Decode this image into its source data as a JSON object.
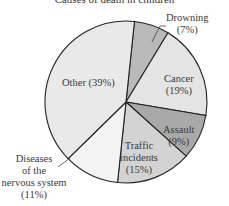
{
  "chart_data": {
    "type": "pie",
    "title": "Causes of death in children",
    "start_angle_deg": 6,
    "slices": [
      {
        "label": "Drowning",
        "pct_label": "(7%)",
        "value": 7,
        "color": "#b9b9b9"
      },
      {
        "label": "Cancer",
        "pct_label": "(19%)",
        "value": 19,
        "color": "#e4e4e4"
      },
      {
        "label": "Assault",
        "pct_label": "(9%)",
        "value": 9,
        "color": "#a9a9a9"
      },
      {
        "label": "Traffic incidents",
        "pct_label": "(15%)",
        "value": 15,
        "color": "#d3d3d3"
      },
      {
        "label": "Diseases of the nervous system",
        "pct_label": "(11%)",
        "value": 11,
        "color": "#f3f3f3"
      },
      {
        "label": "Other",
        "pct_label": "(39%)",
        "value": 39,
        "color": "#e9e9e9"
      }
    ]
  },
  "labels": {
    "drowning": [
      "Drowning",
      "(7%)"
    ],
    "cancer": [
      "Cancer",
      "(19%)"
    ],
    "assault": [
      "Assault",
      "(9%)"
    ],
    "traffic": [
      "Traffic",
      "incidents",
      "(15%)"
    ],
    "diseases": [
      "Diseases",
      "of the",
      "nervous system",
      "(11%)"
    ],
    "other": "Other (39%)"
  }
}
